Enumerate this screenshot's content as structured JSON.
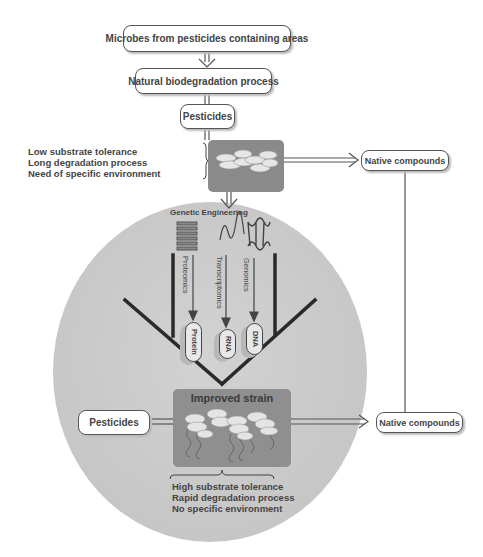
{
  "diagram": {
    "top_boxes": [
      {
        "id": "microbes",
        "label": "Microbes from pesticides containing areas"
      },
      {
        "id": "natural",
        "label": "Natural biodegradation process"
      },
      {
        "id": "pesticides_top",
        "label": "Pesticides"
      }
    ],
    "wild_strain": {
      "traits": [
        "Low substrate tolerance",
        "Long degradation process",
        "Need of specific environment"
      ]
    },
    "native_compounds_top": {
      "label": "Native compounds"
    },
    "genetic_engineering": {
      "title": "Genetic Engineering",
      "approaches": [
        {
          "label": "Proteomics",
          "product": "Protein",
          "icon": "protein-coil-icon"
        },
        {
          "label": "Transcriptomics",
          "product": "RNA",
          "icon": "rna-strand-icon"
        },
        {
          "label": "Genomics",
          "product": "DNA",
          "icon": "dna-helix-icon"
        }
      ]
    },
    "improved_strain": {
      "title": "Improved strain",
      "traits": [
        "High substrate tolerance",
        "Rapid degradation process",
        "No specific environment"
      ]
    },
    "pesticides_bottom": {
      "label": "Pesticides"
    },
    "native_compounds_bottom": {
      "label": "Native compounds"
    },
    "colors": {
      "circle_fill": "#cfcfcf",
      "strain_box": "#8f8f8f",
      "line": "#444444",
      "funnel": "#2a2a2a"
    }
  }
}
